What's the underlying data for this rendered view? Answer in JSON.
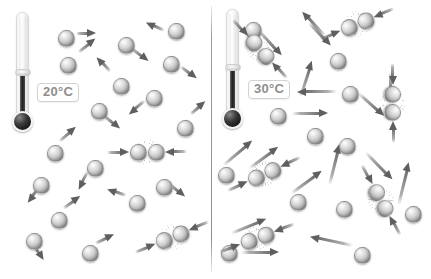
{
  "figure": {
    "background_color": "#ffffff",
    "divider_color": "#8e8e8e",
    "molecule_color": "#9f9f9f",
    "arrow_color": "#5f5f5f"
  },
  "panels": [
    {
      "id": "panel-cool",
      "thermometer": {
        "label": "20°C",
        "mercury_height_pct": 42
      },
      "molecules": [
        {
          "x": 58,
          "y": 30,
          "size": "lg"
        },
        {
          "x": 60,
          "y": 57,
          "size": "lg"
        },
        {
          "x": 118,
          "y": 37,
          "size": "lg"
        },
        {
          "x": 168,
          "y": 23,
          "size": "lg"
        },
        {
          "x": 163,
          "y": 56,
          "size": "lg"
        },
        {
          "x": 113,
          "y": 78,
          "size": "lg"
        },
        {
          "x": 146,
          "y": 90,
          "size": "lg"
        },
        {
          "x": 91,
          "y": 103,
          "size": "lg"
        },
        {
          "x": 177,
          "y": 120,
          "size": "lg"
        },
        {
          "x": 47,
          "y": 145,
          "size": "lg"
        },
        {
          "x": 87,
          "y": 160,
          "size": "lg"
        },
        {
          "x": 33,
          "y": 177,
          "size": "lg"
        },
        {
          "x": 129,
          "y": 195,
          "size": "lg"
        },
        {
          "x": 156,
          "y": 179,
          "size": "lg"
        },
        {
          "x": 51,
          "y": 212,
          "size": "lg"
        },
        {
          "x": 26,
          "y": 233,
          "size": "lg"
        },
        {
          "x": 82,
          "y": 245,
          "size": "lg"
        }
      ],
      "arrows": [
        {
          "x": 76,
          "y": 33,
          "angle": 0,
          "len": 20
        },
        {
          "x": 78,
          "y": 52,
          "angle": -38,
          "len": 22
        },
        {
          "x": 132,
          "y": 48,
          "angle": 38,
          "len": 21
        },
        {
          "x": 164,
          "y": 31,
          "angle": 205,
          "len": 20
        },
        {
          "x": 181,
          "y": 66,
          "angle": 38,
          "len": 20
        },
        {
          "x": 110,
          "y": 72,
          "angle": -132,
          "len": 20
        },
        {
          "x": 145,
          "y": 101,
          "angle": 140,
          "len": 21
        },
        {
          "x": 104,
          "y": 115,
          "angle": 40,
          "len": 21
        },
        {
          "x": 190,
          "y": 114,
          "angle": -40,
          "len": 20
        },
        {
          "x": 59,
          "y": 141,
          "angle": -40,
          "len": 22
        },
        {
          "x": 88,
          "y": 172,
          "angle": 118,
          "len": 20
        },
        {
          "x": 40,
          "y": 187,
          "angle": 128,
          "len": 20
        },
        {
          "x": 126,
          "y": 196,
          "angle": 200,
          "len": 20
        },
        {
          "x": 169,
          "y": 183,
          "angle": 40,
          "len": 21
        },
        {
          "x": 63,
          "y": 208,
          "angle": -35,
          "len": 21
        },
        {
          "x": 33,
          "y": 243,
          "angle": 58,
          "len": 20
        },
        {
          "x": 95,
          "y": 243,
          "angle": -25,
          "len": 21
        }
      ],
      "collisions": [
        {
          "x": 147,
          "y": 152,
          "angle": 0
        },
        {
          "x": 172,
          "y": 237,
          "angle": -22
        }
      ]
    },
    {
      "id": "panel-warm",
      "thermometer": {
        "label": "30°C",
        "mercury_height_pct": 45
      },
      "molecules": [
        {
          "x": 32,
          "y": 22,
          "size": "lg"
        },
        {
          "x": 117,
          "y": 53,
          "size": "lg"
        },
        {
          "x": 129,
          "y": 86,
          "size": "lg"
        },
        {
          "x": 126,
          "y": 138,
          "size": "lg"
        },
        {
          "x": 57,
          "y": 108,
          "size": "lg"
        },
        {
          "x": 94,
          "y": 128,
          "size": "lg"
        },
        {
          "x": 5,
          "y": 167,
          "size": "lg"
        },
        {
          "x": 77,
          "y": 194,
          "size": "lg"
        },
        {
          "x": 123,
          "y": 201,
          "size": "lg"
        },
        {
          "x": 8,
          "y": 245,
          "size": "lg"
        },
        {
          "x": 141,
          "y": 247,
          "size": "lg"
        },
        {
          "x": 192,
          "y": 206,
          "size": "lg"
        }
      ],
      "arrows": [
        {
          "x": 46,
          "y": 30,
          "angle": 48,
          "len": 34
        },
        {
          "x": 96,
          "y": 22,
          "angle": 47,
          "len": 32
        },
        {
          "x": 112,
          "y": 37,
          "angle": -132,
          "len": 34
        },
        {
          "x": 87,
          "y": 97,
          "angle": -72,
          "len": 38
        },
        {
          "x": 79,
          "y": 113,
          "angle": 0,
          "len": 36
        },
        {
          "x": 124,
          "y": 92,
          "angle": 180,
          "len": 40
        },
        {
          "x": 146,
          "y": 93,
          "angle": 42,
          "len": 34
        },
        {
          "x": 116,
          "y": 185,
          "angle": -76,
          "len": 42
        },
        {
          "x": 10,
          "y": 165,
          "angle": -40,
          "len": 38
        },
        {
          "x": 36,
          "y": 168,
          "angle": -36,
          "len": 36
        },
        {
          "x": 78,
          "y": 193,
          "angle": -36,
          "len": 38
        },
        {
          "x": 18,
          "y": 233,
          "angle": -22,
          "len": 38
        },
        {
          "x": 28,
          "y": 252,
          "angle": 0,
          "len": 38
        },
        {
          "x": 140,
          "y": 246,
          "angle": 192,
          "len": 44
        },
        {
          "x": 185,
          "y": 205,
          "angle": -76,
          "len": 44
        },
        {
          "x": 153,
          "y": 152,
          "angle": 46,
          "len": 38
        },
        {
          "x": 178,
          "y": 72,
          "angle": 90,
          "len": 30
        }
      ],
      "collisions": [
        {
          "x": 47,
          "y": 49,
          "angle": 48
        },
        {
          "x": 144,
          "y": 24,
          "angle": -22
        },
        {
          "x": 180,
          "y": 103,
          "angle": 90
        },
        {
          "x": 51,
          "y": 174,
          "angle": -24
        },
        {
          "x": 168,
          "y": 200,
          "angle": 62
        },
        {
          "x": 44,
          "y": 238,
          "angle": -20
        }
      ]
    }
  ]
}
